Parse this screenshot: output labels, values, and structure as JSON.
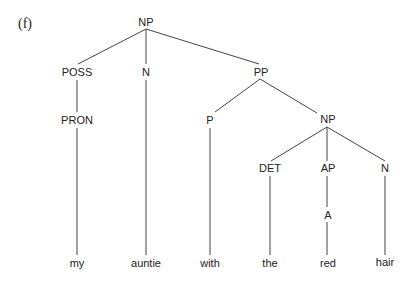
{
  "example_label": "(f)",
  "nodes": {
    "np_root": "NP",
    "poss": "POSS",
    "n1": "N",
    "pp": "PP",
    "pron": "PRON",
    "p": "P",
    "np2": "NP",
    "det": "DET",
    "ap": "AP",
    "n2": "N",
    "a": "A"
  },
  "words": [
    "my",
    "auntie",
    "with",
    "the",
    "red",
    "hair"
  ],
  "colors": {
    "line": "#444444",
    "text": "#222222"
  }
}
